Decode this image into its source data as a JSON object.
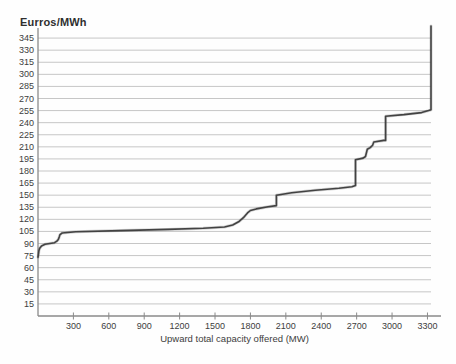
{
  "chart_data": {
    "type": "line",
    "title": "Eurros/MWh",
    "xlabel": "Upward total capacity offered (MW)",
    "ylabel": "Eurros/MWh",
    "legend": "none",
    "grid": "horizontal",
    "xlim": [
      0,
      3330
    ],
    "ylim": [
      0,
      360
    ],
    "x_ticks": [
      300,
      600,
      900,
      1200,
      1500,
      1800,
      2100,
      2400,
      2700,
      3000,
      3300
    ],
    "y_ticks": [
      15,
      30,
      45,
      60,
      75,
      90,
      105,
      120,
      135,
      150,
      165,
      180,
      195,
      210,
      225,
      240,
      255,
      270,
      285,
      300,
      315,
      330,
      345
    ],
    "colors": {
      "curve": "#424242",
      "grid": "#c6c6c6",
      "axis": "#8a8a8a",
      "text": "#3d3d3d",
      "title": "#2f2f2f"
    },
    "series": [
      {
        "name": "upward-offers-supply-curve",
        "points": [
          [
            0,
            73
          ],
          [
            4,
            77
          ],
          [
            8,
            81
          ],
          [
            14,
            84
          ],
          [
            30,
            87
          ],
          [
            60,
            89
          ],
          [
            140,
            91
          ],
          [
            160,
            93
          ],
          [
            172,
            95
          ],
          [
            180,
            98
          ],
          [
            186,
            101
          ],
          [
            205,
            103
          ],
          [
            320,
            104.5
          ],
          [
            700,
            106
          ],
          [
            1100,
            107.5
          ],
          [
            1400,
            109
          ],
          [
            1580,
            110.5
          ],
          [
            1650,
            113
          ],
          [
            1700,
            117
          ],
          [
            1740,
            122
          ],
          [
            1775,
            128
          ],
          [
            1800,
            131
          ],
          [
            1850,
            133
          ],
          [
            1950,
            135.5
          ],
          [
            2020,
            137
          ],
          [
            2020,
            150
          ],
          [
            2150,
            153
          ],
          [
            2350,
            156
          ],
          [
            2550,
            158.5
          ],
          [
            2660,
            160.5
          ],
          [
            2690,
            162
          ],
          [
            2690,
            194
          ],
          [
            2755,
            196
          ],
          [
            2775,
            198
          ],
          [
            2790,
            207
          ],
          [
            2815,
            209
          ],
          [
            2835,
            212
          ],
          [
            2845,
            216
          ],
          [
            2930,
            218
          ],
          [
            2945,
            218
          ],
          [
            2945,
            248
          ],
          [
            3100,
            250
          ],
          [
            3250,
            252.5
          ],
          [
            3310,
            255
          ],
          [
            3330,
            256
          ],
          [
            3330,
            360
          ]
        ]
      }
    ]
  }
}
